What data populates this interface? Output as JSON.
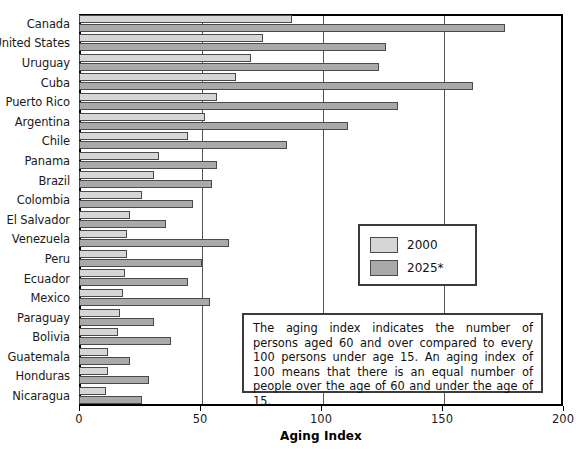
{
  "chart_data": {
    "type": "bar",
    "orientation": "horizontal",
    "title": "",
    "xlabel": "Aging Index",
    "ylabel": "",
    "xlim": [
      0,
      200
    ],
    "xticks": [
      0,
      50,
      100,
      150,
      200
    ],
    "grid": true,
    "grid_axis": "x",
    "legend_position": "center-right",
    "categories": [
      "Canada",
      "United States",
      "Uruguay",
      "Cuba",
      "Puerto Rico",
      "Argentina",
      "Chile",
      "Panama",
      "Brazil",
      "Colombia",
      "El Salvador",
      "Venezuela",
      "Peru",
      "Ecuador",
      "Mexico",
      "Paraguay",
      "Bolivia",
      "Guatemala",
      "Honduras",
      "Nicaragua"
    ],
    "series": [
      {
        "name": "2000",
        "color": "#d6d6d6",
        "values": [
          88,
          76,
          71,
          65,
          57,
          52,
          45,
          33,
          31,
          26,
          21,
          20,
          20,
          19,
          18,
          17,
          16,
          12,
          12,
          11
        ]
      },
      {
        "name": "2025*",
        "color": "#a9a9a9",
        "values": [
          176,
          127,
          124,
          163,
          132,
          111,
          86,
          57,
          55,
          47,
          36,
          62,
          51,
          45,
          54,
          31,
          38,
          21,
          29,
          26
        ]
      }
    ],
    "annotations": [
      "The aging index indicates the number of persons aged 60 and over compared to every 100 persons under age 15. An aging index of 100 means that there is an equal number of people over the age of 60 and under the age of 15."
    ]
  },
  "axis": {
    "x_title": "Aging Index",
    "x_tick_labels": [
      "0",
      "50",
      "100",
      "150",
      "200"
    ]
  },
  "legend": {
    "items": [
      {
        "label": "2000",
        "color": "#d6d6d6"
      },
      {
        "label": "2025*",
        "color": "#a9a9a9"
      }
    ]
  },
  "note": {
    "text": "The aging index indicates the number of persons aged 60 and over compared to every 100 persons under age 15. An aging index of 100 means that there is an equal number of people over the age of 60 and under the age of 15."
  },
  "colors": {
    "series_2000": "#d6d6d6",
    "series_2025": "#a9a9a9",
    "frame": "#000000",
    "gridline": "#555555"
  }
}
